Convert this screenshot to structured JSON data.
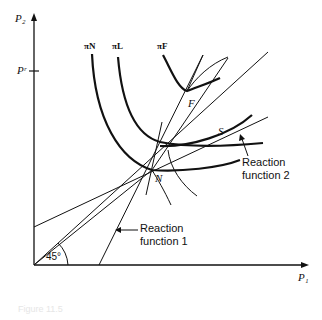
{
  "axes": {
    "y_label": "P₂",
    "x_label": "P₁",
    "y_tick_label": "Pʳ"
  },
  "curves": {
    "pi_n": "πN",
    "pi_l": "πL",
    "pi_f": "πF"
  },
  "points": {
    "n": "N",
    "f": "F",
    "s": "S"
  },
  "annotations": {
    "angle": "45°",
    "reaction1_line1": "Reaction",
    "reaction1_line2": "function 1",
    "reaction2_line1": "Reaction",
    "reaction2_line2": "function 2"
  },
  "caption": "Figure 11.5",
  "colors": {
    "ink": "#111111",
    "background": "#ffffff"
  }
}
